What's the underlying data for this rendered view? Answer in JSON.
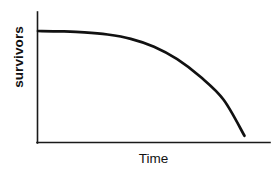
{
  "chart_data": {
    "type": "line",
    "title": "",
    "subtitle": "",
    "xlabel": "Time",
    "ylabel": "survivors",
    "legend": [],
    "annotations": [],
    "grid": false,
    "axes": {
      "x_ticks": [],
      "y_ticks": [],
      "xlim": [
        0,
        1
      ],
      "ylim": [
        0,
        1
      ],
      "x_axis_visible": true,
      "y_axis_visible": true
    },
    "series": [
      {
        "name": "Type I survivorship curve",
        "x": [
          0.0,
          0.1,
          0.2,
          0.3,
          0.4,
          0.5,
          0.6,
          0.7,
          0.8,
          0.89
        ],
        "y": [
          0.855,
          0.852,
          0.845,
          0.828,
          0.795,
          0.735,
          0.64,
          0.505,
          0.33,
          0.055
        ],
        "color": "#111111",
        "style": "solid",
        "width": 2.7
      }
    ]
  },
  "figure": {
    "background_color": "#ffffff",
    "axis_color": "#1a1a1a",
    "curve_color": "#111111",
    "width": 278,
    "height": 174
  },
  "labels": {
    "y_axis_label": "survivors",
    "x_axis_label": "Time"
  }
}
